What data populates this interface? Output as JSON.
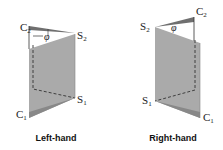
{
  "figures": [
    {
      "id": "left",
      "caption": "Left-hand",
      "points": {
        "C1": {
          "label": "C",
          "sub": "1"
        },
        "C2": {
          "label": "C",
          "sub": "2"
        },
        "S1": {
          "label": "S",
          "sub": "1"
        },
        "S2": {
          "label": "S",
          "sub": "2"
        }
      },
      "angle_label": "φ"
    },
    {
      "id": "right",
      "caption": "Right-hand",
      "points": {
        "C1": {
          "label": "C",
          "sub": "1"
        },
        "C2": {
          "label": "C",
          "sub": "2"
        },
        "S1": {
          "label": "S",
          "sub": "1"
        },
        "S2": {
          "label": "S",
          "sub": "2"
        }
      },
      "angle_label": "φ"
    }
  ],
  "colors": {
    "panel": "#a9a9a9",
    "panel_dark": "#7e7e7e",
    "line": "#333333"
  }
}
